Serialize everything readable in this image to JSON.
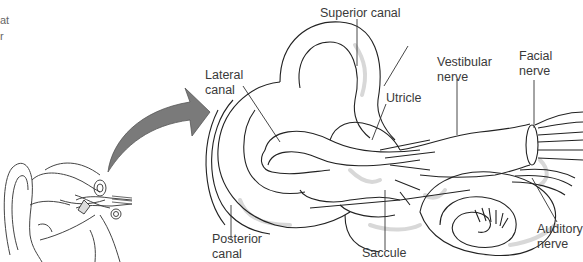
{
  "diagram": {
    "colors": {
      "line": "#222222",
      "arrow_fill": "#7a7a7a",
      "arrow_stroke": "#555555",
      "shading": "#d8d8d8",
      "text": "#3a3a3a"
    },
    "clipped_text_fragment": {
      "line1": "at",
      "line2": "r"
    },
    "labels": [
      {
        "id": "superior-canal",
        "text": "Superior canal"
      },
      {
        "id": "lateral-canal",
        "text": "Lateral\ncanal"
      },
      {
        "id": "utricle",
        "text": "Utricle"
      },
      {
        "id": "vestibular-nerve",
        "text": "Vestibular\nnerve"
      },
      {
        "id": "facial-nerve",
        "text": "Facial\nnerve"
      },
      {
        "id": "posterior-canal",
        "text": "Posterior\ncanal"
      },
      {
        "id": "saccule",
        "text": "Saccule"
      },
      {
        "id": "auditory-nerve",
        "text": "Auditory\nnerve"
      }
    ],
    "inset": {
      "description": "Outer ear with inner ear location",
      "arrow": "curved-arrow pointing to enlarged inner ear"
    }
  }
}
